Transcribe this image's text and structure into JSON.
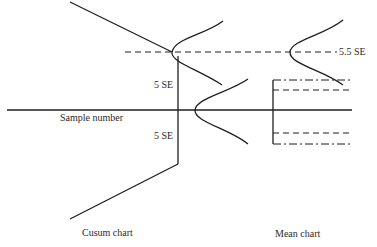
{
  "diagram": {
    "labels": {
      "sample_number": "Sample number",
      "upper_5se": "5 SE",
      "lower_5se": "5 SE",
      "limit_5_5se": "5.5 SE",
      "cusum_caption": "Cusum chart",
      "mean_caption": "Mean chart"
    },
    "colors": {
      "line": "#1e1e1e",
      "background": "#ffffff"
    }
  }
}
